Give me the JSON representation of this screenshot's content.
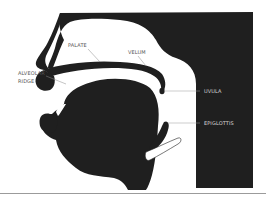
{
  "diagram": {
    "colors": {
      "tissue": "#1f1f1f",
      "background": "#ffffff",
      "label_on_light": "#555555",
      "label_on_dark": "#d8d8d8",
      "rule": "#9b9b9b"
    },
    "labels": {
      "palate": "PALATE",
      "velum": "VELUM",
      "alveolar_ridge_line1": "ALVEOLAR",
      "alveolar_ridge_line2": "RIDGE",
      "uvula": "UVULA",
      "epiglottis": "EPIGLOTTIS"
    }
  }
}
